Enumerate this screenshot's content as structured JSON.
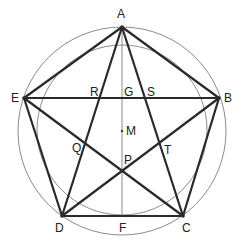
{
  "diagram": {
    "colors": {
      "stroke": "#2a2a2a",
      "circle": "#8a8a8a",
      "axis": "#8a8a8a"
    },
    "points": {
      "A": {
        "label": "A",
        "x": 122,
        "y": 27
      },
      "B": {
        "label": "B",
        "x": 219,
        "y": 98
      },
      "C": {
        "label": "C",
        "x": 183,
        "y": 216
      },
      "D": {
        "label": "D",
        "x": 62,
        "y": 216
      },
      "E": {
        "label": "E",
        "x": 24,
        "y": 98
      },
      "F": {
        "label": "F",
        "x": 122,
        "y": 216
      },
      "G": {
        "label": "G",
        "x": 122,
        "y": 98
      },
      "M": {
        "label": "M",
        "x": 122,
        "y": 131
      },
      "P": {
        "label": "P",
        "x": 122,
        "y": 171
      },
      "Q": {
        "label": "Q",
        "x": 84,
        "y": 143
      },
      "R": {
        "label": "R",
        "x": 99,
        "y": 98
      },
      "S": {
        "label": "S",
        "x": 145,
        "y": 98
      },
      "T": {
        "label": "T",
        "x": 160,
        "y": 143
      }
    },
    "circles": [
      {
        "name": "outer-circle",
        "cx": 122,
        "cy": 131,
        "r": 104
      },
      {
        "name": "inner-circle",
        "cx": 122,
        "cy": 130,
        "r": 85
      }
    ]
  }
}
